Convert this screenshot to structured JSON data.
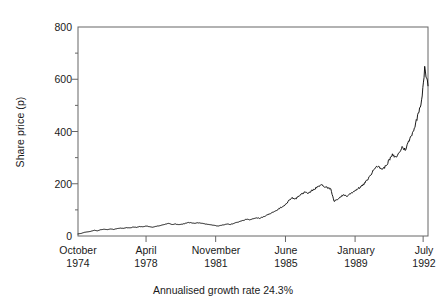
{
  "chart_data": {
    "type": "line",
    "title": "",
    "subtitle": "",
    "xlabel": "",
    "ylabel": "Share price (p)",
    "caption": "Annualised growth rate 24.3%",
    "grid": false,
    "legend": "none",
    "ylim": [
      0,
      800
    ],
    "yticks": [
      0,
      200,
      400,
      600,
      800
    ],
    "ytick_labels": [
      "0",
      "200",
      "400",
      "600",
      "800"
    ],
    "yminor_ticks": [
      100,
      300,
      500,
      700
    ],
    "xlim": [
      1974.75,
      1992.75
    ],
    "xticks": [
      1974.75,
      1978.25,
      1981.83,
      1985.42,
      1989.0,
      1992.5
    ],
    "xtick_labels": [
      {
        "month": "October",
        "year": "1974"
      },
      {
        "month": "April",
        "year": "1978"
      },
      {
        "month": "November",
        "year": "1981"
      },
      {
        "month": "June",
        "year": "1985"
      },
      {
        "month": "January",
        "year": "1989"
      },
      {
        "month": "July",
        "year": "1992"
      }
    ],
    "series": [
      {
        "name": "Share price",
        "color": "#000000",
        "x": [
          1974.75,
          1974.92,
          1975.08,
          1975.25,
          1975.42,
          1975.58,
          1975.75,
          1975.92,
          1976.08,
          1976.25,
          1976.42,
          1976.58,
          1976.75,
          1976.92,
          1977.08,
          1977.25,
          1977.42,
          1977.58,
          1977.75,
          1977.92,
          1978.08,
          1978.25,
          1978.42,
          1978.58,
          1978.75,
          1978.92,
          1979.08,
          1979.25,
          1979.42,
          1979.58,
          1979.75,
          1979.92,
          1980.08,
          1980.25,
          1980.42,
          1980.58,
          1980.75,
          1980.92,
          1981.08,
          1981.25,
          1981.42,
          1981.58,
          1981.75,
          1981.92,
          1982.08,
          1982.25,
          1982.42,
          1982.58,
          1982.75,
          1982.92,
          1983.08,
          1983.25,
          1983.42,
          1983.58,
          1983.75,
          1983.92,
          1984.08,
          1984.25,
          1984.42,
          1984.58,
          1984.75,
          1984.92,
          1985.08,
          1985.25,
          1985.42,
          1985.58,
          1985.75,
          1985.92,
          1986.08,
          1986.25,
          1986.42,
          1986.58,
          1986.75,
          1986.92,
          1987.08,
          1987.25,
          1987.42,
          1987.58,
          1987.75,
          1987.92,
          1988.08,
          1988.25,
          1988.42,
          1988.58,
          1988.75,
          1988.92,
          1989.08,
          1989.25,
          1989.42,
          1989.58,
          1989.75,
          1989.92,
          1990.08,
          1990.25,
          1990.42,
          1990.58,
          1990.75,
          1990.92,
          1991.08,
          1991.25,
          1991.42,
          1991.58,
          1991.75,
          1991.92,
          1992.08,
          1992.25,
          1992.42,
          1992.58,
          1992.75
        ],
        "y": [
          8,
          10,
          14,
          16,
          18,
          22,
          20,
          24,
          26,
          24,
          27,
          25,
          28,
          30,
          29,
          32,
          31,
          34,
          33,
          36,
          35,
          38,
          36,
          34,
          37,
          39,
          42,
          45,
          48,
          44,
          46,
          43,
          45,
          48,
          52,
          50,
          48,
          51,
          49,
          47,
          45,
          43,
          41,
          38,
          40,
          43,
          46,
          44,
          48,
          52,
          55,
          60,
          64,
          62,
          66,
          70,
          68,
          72,
          78,
          84,
          90,
          96,
          104,
          112,
          120,
          134,
          146,
          140,
          152,
          160,
          168,
          162,
          172,
          180,
          188,
          196,
          190,
          186,
          178,
          132,
          140,
          150,
          158,
          152,
          162,
          170,
          178,
          186,
          196,
          210,
          228,
          248,
          270,
          262,
          256,
          268,
          290,
          310,
          300,
          316,
          340,
          330,
          360,
          390,
          420,
          470,
          520,
          640,
          575
        ]
      }
    ]
  }
}
